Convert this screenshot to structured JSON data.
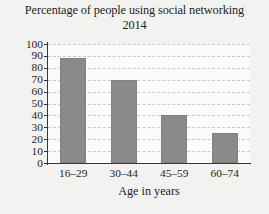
{
  "chart_data": {
    "type": "bar",
    "title": "Percentage of people using social networking",
    "subtitle": "2014",
    "xlabel": "Age in years",
    "ylabel": "",
    "categories": [
      "16–29",
      "30–44",
      "45–59",
      "60–74"
    ],
    "values": [
      88,
      70,
      40,
      25
    ],
    "ylim": [
      0,
      100
    ],
    "ytick_step": 10,
    "yticks": [
      100,
      90,
      80,
      70,
      60,
      50,
      40,
      30,
      20,
      10,
      0
    ],
    "grid": true,
    "legend": "none",
    "bar_color": "#8a8a8a",
    "background_color": "#f2f2f0",
    "plot_background_color": "#fbfbfa",
    "gridline_color": "#c9c9c7",
    "axis_color": "#3a3532",
    "text_color": "#241f1d"
  }
}
